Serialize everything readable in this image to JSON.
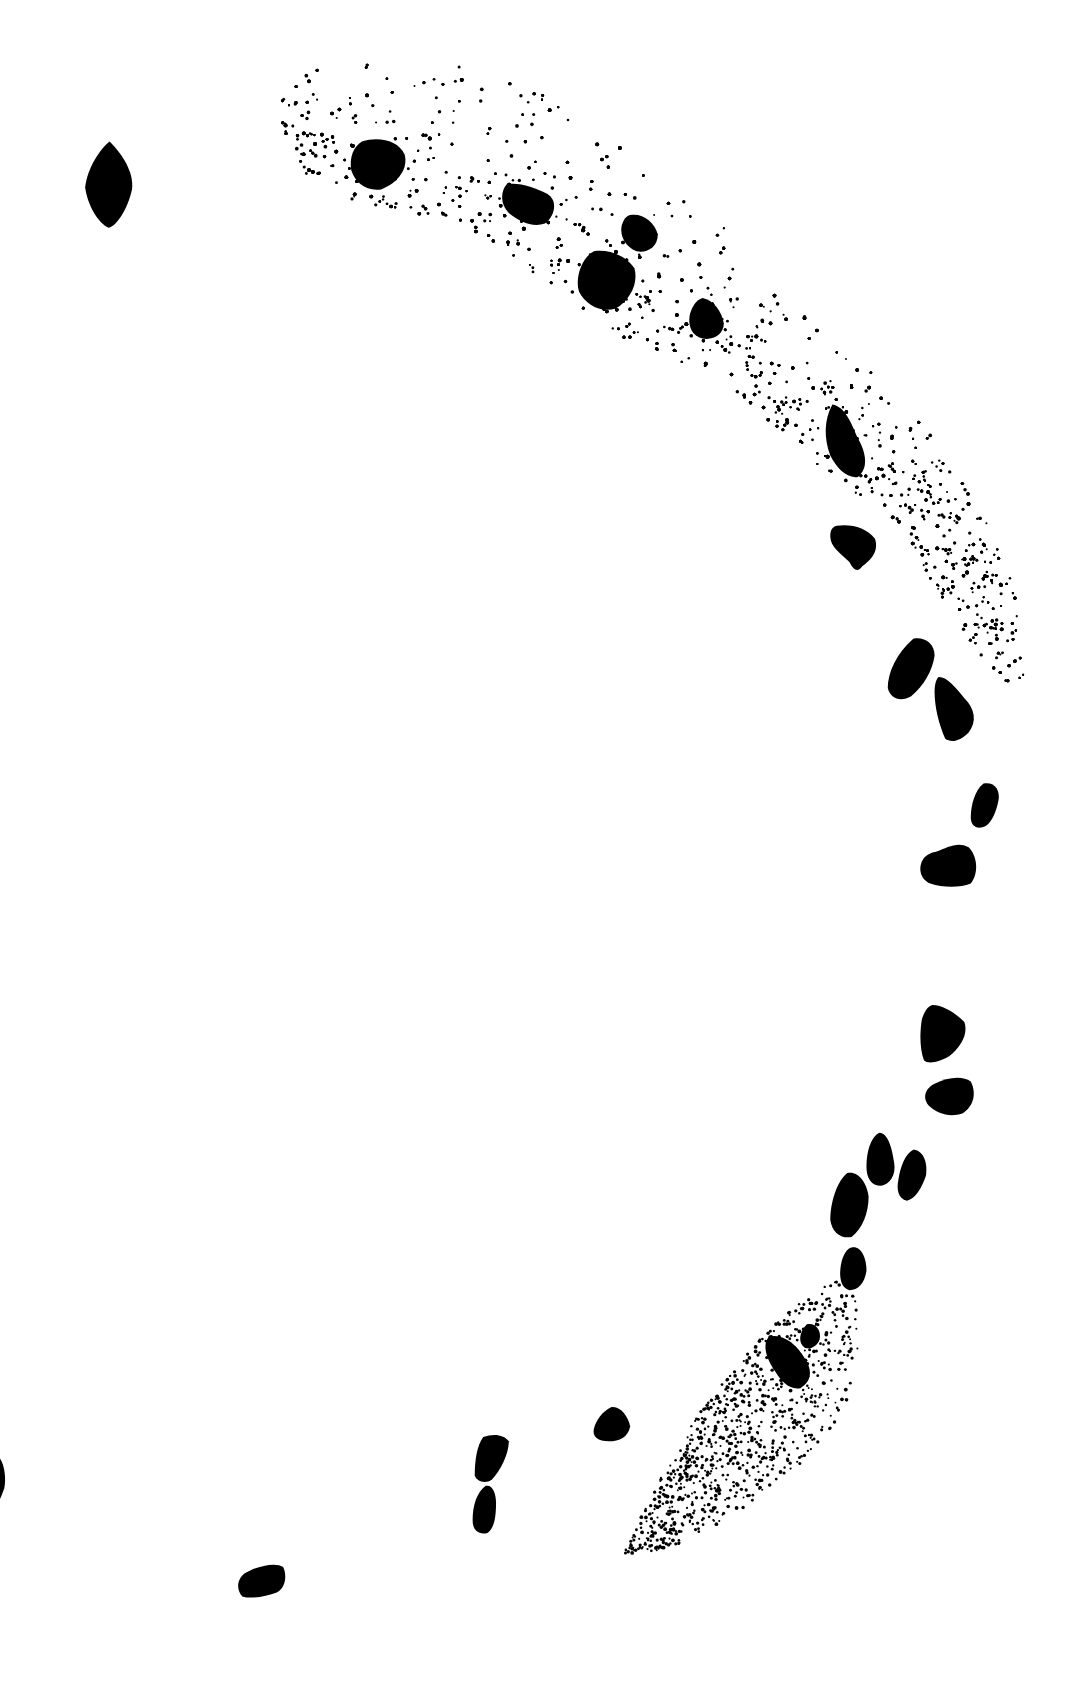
{
  "drawing": {
    "type": "archaeological-plan",
    "background_color": "#ffffff",
    "ink_color": "#000000",
    "viewbox": [
      1024,
      1581
    ],
    "stipple_zones": [
      {
        "id": "upper-arc-fill",
        "outline": [
          [
            258,
            88
          ],
          [
            300,
            62
          ],
          [
            360,
            55
          ],
          [
            430,
            60
          ],
          [
            500,
            80
          ],
          [
            560,
            110
          ],
          [
            620,
            160
          ],
          [
            680,
            210
          ],
          [
            740,
            270
          ],
          [
            800,
            330
          ],
          [
            850,
            380
          ],
          [
            900,
            440
          ],
          [
            935,
            500
          ],
          [
            955,
            560
          ],
          [
            962,
            640
          ],
          [
            940,
            640
          ],
          [
            905,
            600
          ],
          [
            880,
            555
          ],
          [
            850,
            500
          ],
          [
            800,
            460
          ],
          [
            760,
            430
          ],
          [
            720,
            395
          ],
          [
            680,
            360
          ],
          [
            630,
            335
          ],
          [
            590,
            320
          ],
          [
            540,
            290
          ],
          [
            500,
            255
          ],
          [
            455,
            225
          ],
          [
            410,
            205
          ],
          [
            360,
            195
          ],
          [
            320,
            190
          ],
          [
            290,
            170
          ],
          [
            268,
            130
          ]
        ],
        "dense_edge": "inner",
        "dot_count": 2600
      },
      {
        "id": "lower-arc-fill",
        "outline": [
          [
            800,
            1195
          ],
          [
            808,
            1230
          ],
          [
            805,
            1290
          ],
          [
            790,
            1330
          ],
          [
            760,
            1370
          ],
          [
            720,
            1400
          ],
          [
            680,
            1430
          ],
          [
            640,
            1450
          ],
          [
            600,
            1462
          ],
          [
            585,
            1460
          ],
          [
            605,
            1420
          ],
          [
            625,
            1380
          ],
          [
            655,
            1330
          ],
          [
            685,
            1290
          ],
          [
            715,
            1255
          ],
          [
            750,
            1225
          ],
          [
            780,
            1205
          ]
        ],
        "dense_edge": "left",
        "dot_count": 900
      }
    ],
    "stones": [
      {
        "id": "s1",
        "d": "M103,133 C115,145 126,162 124,178 C120,196 110,212 102,214 C92,210 82,192 80,176 C82,158 94,140 103,133 Z"
      },
      {
        "id": "s2",
        "d": "M340,133 C356,128 374,132 380,145 C384,158 374,172 358,178 C344,180 334,172 330,160 C328,148 332,138 340,133 Z"
      },
      {
        "id": "s3",
        "d": "M476,173 C488,171 502,176 514,182 C524,188 522,202 512,210 C500,214 488,208 478,200 C470,192 470,180 476,173 Z"
      },
      {
        "id": "s4",
        "d": "M592,202 C604,200 614,208 618,220 C618,232 608,238 598,236 C588,232 582,222 584,212 C586,206 588,203 592,202 Z"
      },
      {
        "id": "s5",
        "d": "M558,236 C572,234 588,240 596,252 C600,266 592,282 578,290 C564,294 550,286 544,274 C540,262 546,242 558,236 Z"
      },
      {
        "id": "s6",
        "d": "M660,280 C670,282 678,292 680,304 C680,314 670,320 660,318 C650,316 646,306 648,296 C650,288 654,282 660,280 Z"
      },
      {
        "id": "s7",
        "d": "M782,380 C794,382 800,398 806,412 C814,426 816,440 806,448 C796,450 786,440 780,428 C774,412 774,394 782,380 Z"
      },
      {
        "id": "s8",
        "d": "M786,494 C800,492 814,496 822,506 C826,518 818,526 810,532 C806,538 802,536 798,528 C790,520 780,514 780,504 C780,498 782,495 786,494 Z"
      },
      {
        "id": "s9",
        "d": "M858,600 C868,598 878,604 878,616 C876,630 868,644 856,654 C846,660 836,656 834,646 C834,632 842,614 858,600 Z"
      },
      {
        "id": "s10",
        "d": "M882,636 C890,636 898,646 906,656 C916,666 918,678 910,688 C902,696 894,698 888,694 C882,680 878,664 878,650 C878,642 880,637 882,636 Z"
      },
      {
        "id": "s11",
        "d": "M924,736 C934,734 940,742 938,752 C936,762 932,772 926,776 C918,780 912,776 912,768 C912,756 916,742 924,736 Z"
      },
      {
        "id": "s12",
        "d": "M880,800 C890,796 900,790 910,796 C918,804 920,820 912,830 C902,834 886,834 874,830 C864,826 862,814 868,806 C872,802 876,801 880,800 Z"
      },
      {
        "id": "s13",
        "d": "M876,944 C886,944 898,952 906,960 C910,972 902,984 892,992 C882,998 872,1000 868,996 C864,986 864,970 866,958 C868,950 872,945 876,944 Z"
      },
      {
        "id": "s14",
        "d": "M878,1018 C890,1012 904,1010 912,1016 C918,1028 914,1040 904,1046 C892,1050 880,1046 872,1038 C866,1030 870,1022 878,1018 Z"
      },
      {
        "id": "s15",
        "d": "M826,1064 C834,1064 838,1078 840,1092 C842,1104 836,1112 828,1114 C818,1114 814,1106 814,1096 C814,1082 818,1068 826,1064 Z"
      },
      {
        "id": "s16",
        "d": "M858,1080 C866,1080 872,1090 870,1104 C866,1116 860,1126 852,1128 C844,1126 842,1118 844,1108 C846,1096 850,1084 858,1080 Z"
      },
      {
        "id": "s17",
        "d": "M796,1102 C806,1100 814,1110 816,1124 C816,1140 810,1154 800,1162 C790,1164 782,1158 780,1146 C780,1130 786,1110 796,1102 Z"
      },
      {
        "id": "s18",
        "d": "M800,1172 C808,1170 814,1180 814,1194 C812,1206 806,1212 798,1212 C790,1210 788,1200 790,1188 C792,1178 796,1173 800,1172 Z"
      },
      {
        "id": "s19",
        "d": "M758,1244 C766,1242 772,1250 770,1258 C768,1264 762,1268 756,1266 C750,1262 750,1252 758,1244 Z"
      },
      {
        "id": "s20",
        "d": "M722,1256 C734,1252 748,1262 756,1276 C764,1288 762,1298 752,1304 C742,1306 734,1298 728,1288 C720,1276 716,1264 722,1256 Z"
      },
      {
        "id": "s21",
        "d": "M574,1322 C582,1320 590,1330 592,1340 C590,1350 582,1354 572,1354 C562,1354 556,1350 558,1342 C560,1334 566,1326 574,1322 Z"
      },
      {
        "id": "s22",
        "d": "M454,1350 C464,1346 474,1348 478,1354 C478,1366 470,1382 462,1390 C456,1394 448,1392 446,1386 C446,1372 448,1358 454,1350 Z"
      },
      {
        "id": "s23",
        "d": "M456,1396 C462,1394 466,1402 466,1412 C466,1426 464,1436 458,1440 C450,1442 444,1438 444,1428 C444,1414 448,1402 456,1396 Z"
      },
      {
        "id": "s24",
        "d": "M238,1474 C248,1470 260,1468 266,1472 C270,1480 268,1492 260,1496 C250,1500 236,1502 228,1500 C222,1494 222,1484 230,1478 C234,1476 236,1475 238,1474 Z"
      },
      {
        "id": "s25",
        "d": "M0,1370 C4,1376 6,1388 4,1398 C2,1404 0,1408 0,1408 Z"
      }
    ]
  }
}
